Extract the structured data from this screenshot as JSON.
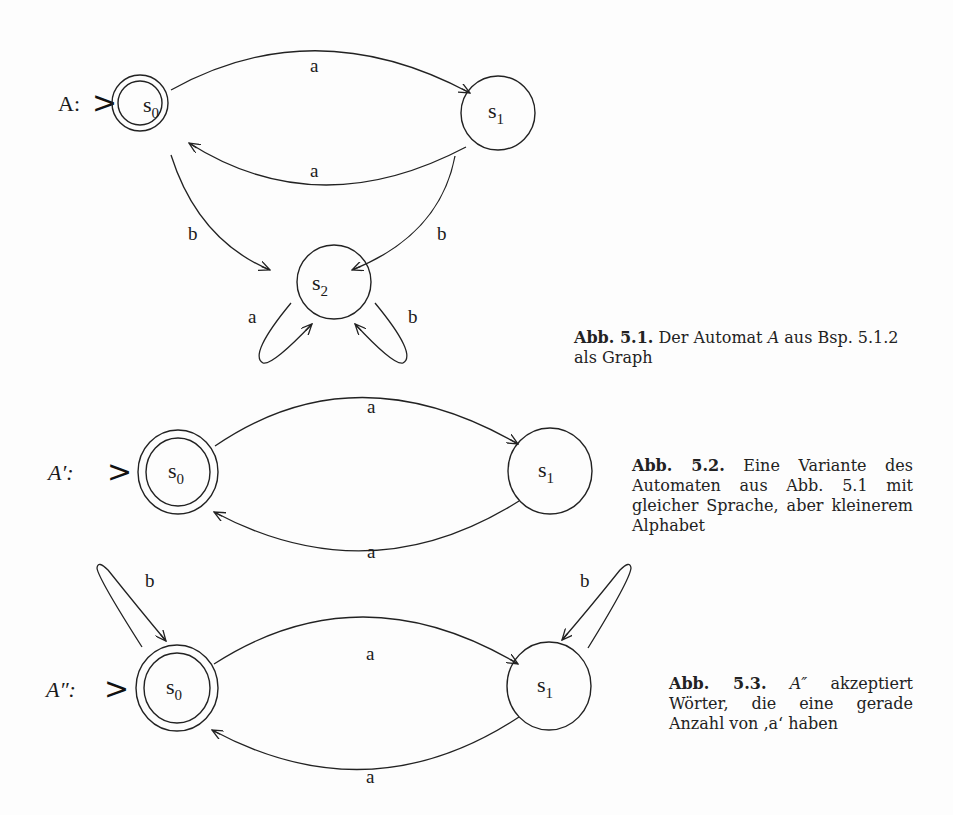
{
  "figures": [
    {
      "id": "fig-5-1",
      "automaton_label": "A:",
      "states": [
        {
          "name": "s",
          "sub": "0",
          "start": true,
          "accepting": true
        },
        {
          "name": "s",
          "sub": "1",
          "start": false,
          "accepting": false
        },
        {
          "name": "s",
          "sub": "2",
          "start": false,
          "accepting": false
        }
      ],
      "transitions": [
        {
          "from": "s0",
          "to": "s1",
          "label": "a"
        },
        {
          "from": "s1",
          "to": "s0",
          "label": "a"
        },
        {
          "from": "s0",
          "to": "s2",
          "label": "b"
        },
        {
          "from": "s1",
          "to": "s2",
          "label": "b"
        },
        {
          "from": "s2",
          "to": "s2",
          "label": "a"
        },
        {
          "from": "s2",
          "to": "s2",
          "label": "b"
        }
      ],
      "caption": {
        "number": "Abb. 5.1.",
        "text_before": "Der Automat",
        "italic": "A",
        "text_after": "aus Bsp. 5.1.2 als Graph"
      }
    },
    {
      "id": "fig-5-2",
      "automaton_label": "A′:",
      "states": [
        {
          "name": "s",
          "sub": "0",
          "start": true,
          "accepting": true
        },
        {
          "name": "s",
          "sub": "1",
          "start": false,
          "accepting": false
        }
      ],
      "transitions": [
        {
          "from": "s0",
          "to": "s1",
          "label": "a"
        },
        {
          "from": "s1",
          "to": "s0",
          "label": "a"
        }
      ],
      "caption": {
        "number": "Abb. 5.2.",
        "text": "Eine Variante des Automaten aus Abb. 5.1 mit gleicher Sprache, aber kleinerem Alphabet"
      }
    },
    {
      "id": "fig-5-3",
      "automaton_label": "A″:",
      "states": [
        {
          "name": "s",
          "sub": "0",
          "start": true,
          "accepting": true
        },
        {
          "name": "s",
          "sub": "1",
          "start": false,
          "accepting": false
        }
      ],
      "transitions": [
        {
          "from": "s0",
          "to": "s1",
          "label": "a"
        },
        {
          "from": "s1",
          "to": "s0",
          "label": "a"
        },
        {
          "from": "s0",
          "to": "s0",
          "label": "b"
        },
        {
          "from": "s1",
          "to": "s1",
          "label": "b"
        }
      ],
      "caption": {
        "number": "Abb. 5.3.",
        "italic": "A″",
        "text_after": "akzeptiert Wörter, die eine gerade Anzahl von ‚a‘ haben"
      }
    }
  ],
  "start_marker": ">"
}
